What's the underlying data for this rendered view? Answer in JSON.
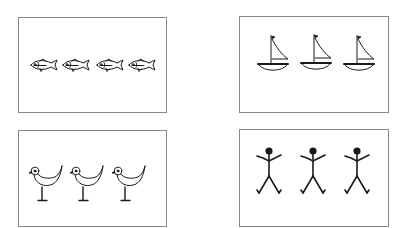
{
  "figure": {
    "stroke_color": "#1a1a1a",
    "border_color": "#8a8a8a",
    "panels": [
      {
        "id": "fish",
        "label": "fish",
        "count": 4,
        "icon": "fish-icon",
        "style": "outline"
      },
      {
        "id": "sailboats",
        "label": "sailboats",
        "count": 3,
        "icon": "sailboat-icon",
        "style": "outline"
      },
      {
        "id": "birds",
        "label": "birds",
        "count": 3,
        "icon": "bird-icon",
        "style": "outline"
      },
      {
        "id": "stick-figures",
        "label": "stick figures",
        "count": 3,
        "icon": "stick-figure-icon",
        "style": "solid"
      }
    ]
  }
}
